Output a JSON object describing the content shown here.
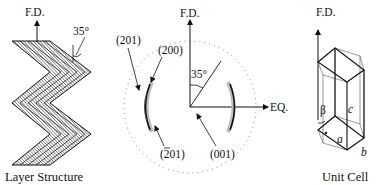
{
  "figure": {
    "panels": {
      "layer_structure": {
        "axis_label": "F.D.",
        "angle_label": "35°",
        "caption": "Layer Structure"
      },
      "diffraction_pattern": {
        "axis_vertical_label": "F.D.",
        "axis_horizontal_label": "EQ.",
        "angle_label": "35°",
        "reflections": [
          {
            "label": "(201)",
            "overbar": false
          },
          {
            "label": "(200)",
            "overbar": false
          },
          {
            "label": "(201)",
            "overbar": true
          },
          {
            "label": "(001)",
            "overbar": false
          }
        ]
      },
      "unit_cell": {
        "axis_label": "F.D.",
        "angle_label": "β",
        "edge_labels": {
          "a": "a",
          "b": "b",
          "c": "c"
        },
        "caption": "Unit Cell"
      }
    },
    "colors": {
      "ink": "#111111",
      "paper": "#ffffff"
    }
  }
}
